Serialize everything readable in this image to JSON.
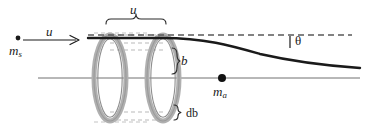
{
  "figure": {
    "type": "scattering-cross-section-diagram",
    "labels": {
      "speed_top": "u",
      "speed_arrow": "u",
      "incident_mass": "m",
      "incident_mass_sub": "s",
      "impact_parameter": "b",
      "impact_parameter_thickness": "db",
      "target_mass": "m",
      "target_mass_sub": "a",
      "deflection_angle": "θ"
    },
    "colors": {
      "ink": "#1a1a1a",
      "annulus_gray": "#a8a8a8",
      "annulus_fill": "#cfcfcf",
      "dash_gray": "#b5b5b5",
      "axis_gray": "#707070",
      "background": "#ffffff"
    },
    "geometry": {
      "axis_y": 78,
      "trajectory_y": 38,
      "left_ring_cx": 110,
      "right_ring_cx": 163,
      "ring_rx": 16,
      "ring_ry": 43,
      "ring_thickness": 4,
      "incident_dot": {
        "x": 18,
        "y": 38
      },
      "target_dot": {
        "x": 222,
        "y": 78
      },
      "arrow": {
        "x1": 23,
        "y1": 40,
        "x2": 79,
        "y2": 40
      },
      "curve_start_x": 163,
      "curve_end": {
        "x": 360,
        "y": 68
      },
      "dashed_line": {
        "x1": 88,
        "y1": 35,
        "x2": 352,
        "y2": 35
      },
      "brace_top": {
        "x1": 110,
        "y1": 24,
        "x2": 163,
        "y2": 24
      }
    }
  }
}
